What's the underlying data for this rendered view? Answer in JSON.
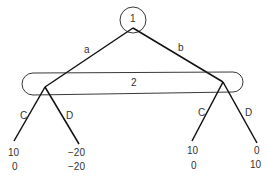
{
  "diagram": {
    "type": "extensive-form game tree",
    "root": {
      "player_label": "1"
    },
    "root_actions": {
      "left": "a",
      "right": "b"
    },
    "information_set": {
      "player_label": "2"
    },
    "player2_actions": {
      "left_node": {
        "left": "C",
        "right": "D"
      },
      "right_node": {
        "left": "C",
        "right": "D"
      }
    },
    "payoffs": [
      {
        "path": "a-C",
        "p1": "10",
        "p2": "0"
      },
      {
        "path": "a-D",
        "p1": "−20",
        "p2": "−20"
      },
      {
        "path": "b-C",
        "p1": "10",
        "p2": "0"
      },
      {
        "path": "b-D",
        "p1": "0",
        "p2": "10"
      }
    ]
  }
}
